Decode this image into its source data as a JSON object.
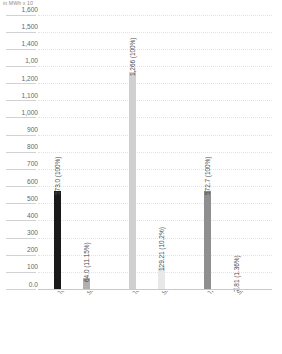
{
  "chart_data": {
    "type": "bar",
    "title": "",
    "subtitle": "",
    "unit_caption": "in MWh x 10",
    "unit_exponent": "-",
    "xlabel": "",
    "ylabel": "",
    "ylim": [
      0,
      1600
    ],
    "grid": true,
    "legend": null,
    "ytick_labels": [
      "1,600",
      "1,500",
      "1,400",
      "1,00",
      "1,200",
      "1,100",
      "1,000",
      "900",
      "800",
      "700",
      "600",
      "500",
      "400",
      "300",
      "200",
      "100",
      "0.0"
    ],
    "ytick_values": [
      1600,
      1500,
      1400,
      1300,
      1200,
      1100,
      1000,
      900,
      800,
      700,
      600,
      500,
      400,
      300,
      200,
      100,
      0
    ],
    "categories": [
      "Total electricity generation",
      "Share of renewable energy",
      "Total energy generation",
      "Share of renewable energy",
      "Transportation",
      "Share of renewable energy"
    ],
    "values": [
      573.0,
      64.0,
      1266.0,
      129.21,
      572.7,
      7.81
    ],
    "value_labels": [
      "573.0 (100%)",
      "64.0 (11.15%)",
      "1,266 (100%)",
      "129.21 (10.2%)",
      "572.7 (100%)",
      "7.81 (1.36%)"
    ],
    "percentages": [
      "100%",
      "11.15%",
      "100%",
      "10.2%",
      "100%",
      "1.36%"
    ],
    "bar_colors": [
      "#1a1a1a",
      "#b0b0b0",
      "#d0d0d0",
      "#e8e8e8",
      "#8f8f8f",
      "#dcdcdc"
    ],
    "groups": [
      {
        "name": "Electricity",
        "bar_indices": [
          0,
          1
        ]
      },
      {
        "name": "Energy",
        "bar_indices": [
          2,
          3
        ]
      },
      {
        "name": "Transportation",
        "bar_indices": [
          4,
          5
        ]
      }
    ]
  }
}
